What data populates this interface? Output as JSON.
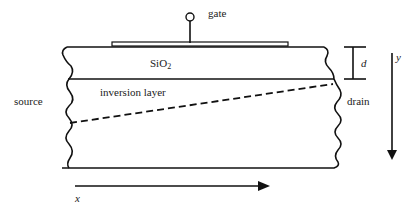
{
  "diagram": {
    "labels": {
      "gate": "gate",
      "oxide_main": "SiO",
      "oxide_sub": "2",
      "inversion_layer": "inversion layer",
      "source": "source",
      "drain": "drain",
      "thickness": "d",
      "axis_x": "x",
      "axis_y": "y"
    },
    "colors": {
      "stroke": "#111111",
      "text": "#222222",
      "background": "#ffffff"
    }
  }
}
